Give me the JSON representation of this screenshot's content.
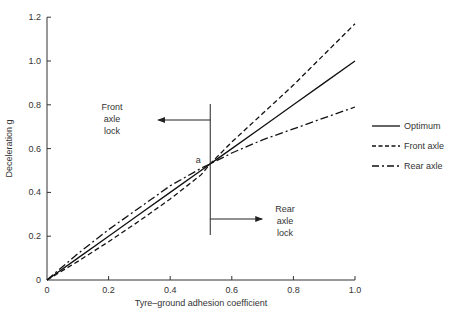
{
  "chart_data": {
    "type": "line",
    "title": "",
    "xlabel": "Tyre–ground adhesion coefficient",
    "ylabel": "Deceleration g",
    "xlim": [
      0,
      1.0
    ],
    "ylim": [
      0,
      1.2
    ],
    "xticks": [
      "0",
      "0.2",
      "0.4",
      "0.6",
      "0.8",
      "1.0"
    ],
    "yticks": [
      "0",
      "0.2",
      "0.4",
      "0.6",
      "0.8",
      "1.0",
      "1.2"
    ],
    "grid": false,
    "legend_position": "right",
    "x": [
      0,
      0.1,
      0.2,
      0.3,
      0.4,
      0.5,
      0.53,
      0.6,
      0.7,
      0.8,
      0.9,
      1.0
    ],
    "series": [
      {
        "name": "Optimum",
        "style": "solid",
        "values": [
          0,
          0.1,
          0.2,
          0.3,
          0.4,
          0.5,
          0.53,
          0.6,
          0.7,
          0.8,
          0.9,
          1.0
        ]
      },
      {
        "name": "Front axle",
        "style": "dashed",
        "values": [
          0,
          0.085,
          0.175,
          0.27,
          0.37,
          0.48,
          0.53,
          0.63,
          0.76,
          0.89,
          1.03,
          1.17
        ]
      },
      {
        "name": "Rear axle",
        "style": "dash-dot",
        "values": [
          0,
          0.12,
          0.23,
          0.33,
          0.43,
          0.51,
          0.53,
          0.58,
          0.64,
          0.69,
          0.74,
          0.79
        ]
      }
    ],
    "annotations": [
      {
        "text": "a",
        "x": 0.5,
        "y": 0.55
      },
      {
        "text": "Front axle lock",
        "arrow": "left",
        "x": 0.53,
        "y": 0.73
      },
      {
        "text": "Rear axle lock",
        "arrow": "right",
        "x": 0.53,
        "y": 0.3
      }
    ],
    "vertical_line_x": 0.53
  },
  "labels": {
    "xlabel": "Tyre–ground adhesion coefficient",
    "ylabel": "Deceleration g",
    "point_a": "a",
    "front_lock": [
      "Front",
      "axle",
      "lock"
    ],
    "rear_lock": [
      "Rear",
      "axle",
      "lock"
    ],
    "legend": [
      "Optimum",
      "Front axle",
      "Rear axle"
    ]
  }
}
